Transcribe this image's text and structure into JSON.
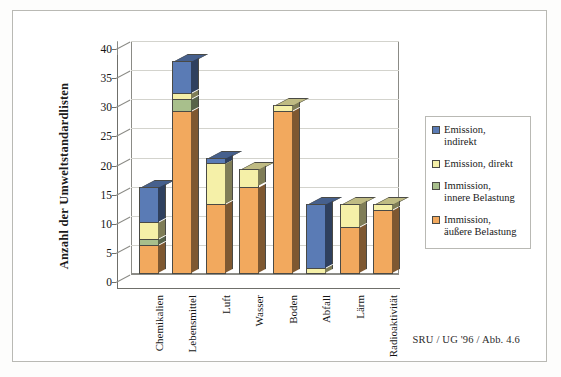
{
  "figure": {
    "source_note": "SRU / UG '96 / Abb. 4.6"
  },
  "legend": {
    "title": "",
    "items": [
      {
        "label": "Emission, indirekt",
        "line1": "Emission,",
        "line2": "indirekt",
        "color": "#5a7bb5",
        "key": "emission_indirekt"
      },
      {
        "label": "Emission, direkt",
        "line1": "Emission, direkt",
        "line2": "",
        "color": "#f5f0a8",
        "key": "emission_direkt"
      },
      {
        "label": "Immission, innere Belastung",
        "line1": "Immission,",
        "line2": "innere Belastung",
        "color": "#a8bf8c",
        "key": "immission_innere"
      },
      {
        "label": "Immission, äußere Belastung",
        "line1": "Immission,",
        "line2": "äußere Belastung",
        "color": "#f2a95e",
        "key": "immission_aeussere"
      }
    ]
  },
  "chart_data": {
    "type": "bar",
    "subtype": "stacked-3d-column",
    "title": "",
    "xlabel": "",
    "ylabel": "Anzahl der Umweltstandardlisten",
    "ylim": [
      0,
      40
    ],
    "ytick_step": 5,
    "yticks": [
      0,
      5,
      10,
      15,
      20,
      25,
      30,
      35,
      40
    ],
    "grid": true,
    "legend_position": "right",
    "categories": [
      "Chemikalien",
      "Lebensmittel",
      "Luft",
      "Wasser",
      "Boden",
      "Abfall",
      "Lärm",
      "Radioaktivität"
    ],
    "series": [
      {
        "name": "Immission, äußere Belastung",
        "color": "#f2a95e",
        "values": [
          5,
          28,
          12,
          15,
          28,
          0,
          8,
          11
        ]
      },
      {
        "name": "Immission, innere Belastung",
        "color": "#a8bf8c",
        "values": [
          1,
          2,
          0,
          0,
          0,
          0,
          0,
          0
        ]
      },
      {
        "name": "Emission, direkt",
        "color": "#f5f0a8",
        "values": [
          3,
          1,
          7,
          3,
          1,
          1,
          4,
          1
        ]
      },
      {
        "name": "Emission, indirekt",
        "color": "#5a7bb5",
        "values": [
          6,
          5.5,
          1,
          0,
          0,
          11,
          0,
          0
        ]
      }
    ],
    "totals": [
      15,
      36.5,
      20,
      18,
      29,
      12,
      12,
      12
    ]
  }
}
